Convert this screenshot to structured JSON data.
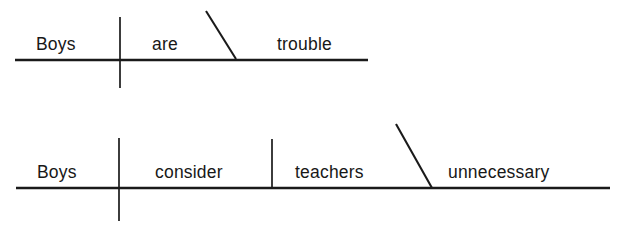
{
  "page": {
    "type": "sentence-diagram-figure",
    "background_color": "#ffffff",
    "line_color": "#1a1a1a",
    "text_color": "#181818"
  },
  "diagrams": [
    {
      "id": "diagram-1",
      "sentence": "Boys are trouble",
      "words": {
        "subject": "Boys",
        "verb": "are",
        "complement": "trouble"
      },
      "lines": {
        "baseline": {
          "x1": 15,
          "y1": 60,
          "x2": 368,
          "y2": 60
        },
        "subject_verb_divider": {
          "x1": 120,
          "y1": 17,
          "x2": 120,
          "y2": 88
        },
        "predicate_slant": {
          "x1": 206,
          "y1": 11,
          "x2": 236,
          "y2": 59
        }
      }
    },
    {
      "id": "diagram-2",
      "sentence": "Boys consider teachers unnecessary",
      "words": {
        "subject": "Boys",
        "verb": "consider",
        "object": "teachers",
        "complement": "unnecessary"
      },
      "lines": {
        "baseline": {
          "x1": 16,
          "y1": 188,
          "x2": 610,
          "y2": 188
        },
        "subject_verb_divider": {
          "x1": 119,
          "y1": 138,
          "x2": 119,
          "y2": 221
        },
        "verb_object_divider": {
          "x1": 272,
          "y1": 139,
          "x2": 272,
          "y2": 188
        },
        "object_complement_slant": {
          "x1": 396,
          "y1": 124,
          "x2": 432,
          "y2": 188
        }
      }
    }
  ]
}
